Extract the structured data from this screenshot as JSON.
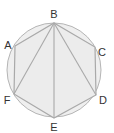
{
  "diagram": {
    "type": "inscribed-hexagon",
    "colors": {
      "circle_fill": "#efefef",
      "stroke": "#a9a9a9",
      "label": "#333333",
      "background": "#ffffff"
    },
    "circle": {
      "cx": 54,
      "cy": 70,
      "r": 47
    },
    "points": {
      "A": {
        "x": 15,
        "y": 46
      },
      "B": {
        "x": 54,
        "y": 23
      },
      "C": {
        "x": 95,
        "y": 47
      },
      "D": {
        "x": 96,
        "y": 95
      },
      "E": {
        "x": 54,
        "y": 118
      },
      "F": {
        "x": 14,
        "y": 94
      }
    },
    "labels": {
      "A": "A",
      "B": "B",
      "C": "C",
      "D": "D",
      "E": "E",
      "F": "F"
    },
    "hexagon_order": [
      "A",
      "B",
      "C",
      "D",
      "E",
      "F"
    ],
    "diagonals": [
      [
        "B",
        "F"
      ],
      [
        "B",
        "E"
      ],
      [
        "B",
        "D"
      ]
    ]
  }
}
